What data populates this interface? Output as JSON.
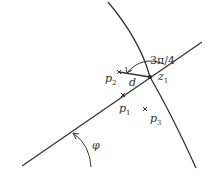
{
  "diagram": {
    "labels": {
      "angle_top": "3π/4",
      "p2": "p",
      "p2_sub": "2",
      "d": "d",
      "z1": "z",
      "z1_sub": "1",
      "p1": "p",
      "p1_sub": "1",
      "p3": "p",
      "p3_sub": "3",
      "phi": "φ"
    },
    "colors": {
      "stroke": "#333333",
      "background": "#ffffff"
    }
  }
}
